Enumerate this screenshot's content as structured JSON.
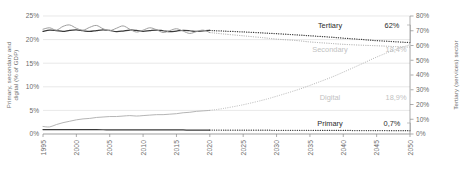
{
  "chart_data": {
    "type": "line",
    "title": "",
    "xlabel": "",
    "ylabel": "Primary, secondary and digital (% of GDP)",
    "y2label": "Tertiary (services) sector",
    "xlim": [
      1995,
      2050
    ],
    "ylim": [
      0,
      25
    ],
    "y2lim": [
      0,
      80
    ],
    "grid": true,
    "legend_position": "inline-right-callouts",
    "forecast_start": 2020,
    "x_ticks": [
      1995,
      2000,
      2005,
      2010,
      2015,
      2020,
      2025,
      2030,
      2035,
      2040,
      2045,
      2050
    ],
    "y_ticks": [
      "0%",
      "5%",
      "10%",
      "15%",
      "20%",
      "25%"
    ],
    "y2_ticks": [
      "0%",
      "10%",
      "20%",
      "30%",
      "40%",
      "50%",
      "60%",
      "70%",
      "80%"
    ],
    "series": [
      {
        "name": "Tertiary",
        "end_label": "62%",
        "axis": "right",
        "color": "#3a3a3a",
        "x": [
          1995,
          1996,
          1997,
          1998,
          1999,
          2000,
          2001,
          2002,
          2003,
          2004,
          2005,
          2006,
          2007,
          2008,
          2009,
          2010,
          2011,
          2012,
          2013,
          2014,
          2015,
          2016,
          2017,
          2018,
          2019,
          2020,
          2022,
          2025,
          2028,
          2030,
          2033,
          2035,
          2038,
          2040,
          2043,
          2045,
          2048,
          2050
        ],
        "values": [
          69.6,
          70.4,
          70.1,
          69.6,
          70.3,
          70.6,
          70.0,
          69.5,
          70.1,
          70.6,
          70.2,
          69.4,
          69.8,
          70.5,
          70.2,
          69.6,
          70.1,
          70.5,
          70.0,
          69.4,
          69.8,
          70.3,
          70.0,
          69.5,
          69.9,
          70.2,
          69.8,
          69.2,
          68.5,
          68.0,
          67.2,
          66.6,
          65.7,
          65.0,
          64.0,
          63.3,
          62.5,
          62.0
        ]
      },
      {
        "name": "Secondary",
        "end_label": "18,4%",
        "axis": "left",
        "color": "#9e9e9e",
        "x": [
          1995,
          1996,
          1997,
          1998,
          1999,
          2000,
          2001,
          2002,
          2003,
          2004,
          2005,
          2006,
          2007,
          2008,
          2009,
          2010,
          2011,
          2012,
          2013,
          2014,
          2015,
          2016,
          2017,
          2018,
          2019,
          2020,
          2022,
          2025,
          2028,
          2030,
          2033,
          2035,
          2038,
          2040,
          2043,
          2045,
          2048,
          2050
        ],
        "values": [
          22.2,
          22.5,
          22.0,
          22.8,
          23.1,
          22.4,
          22.0,
          22.6,
          23.0,
          22.3,
          21.9,
          22.4,
          22.9,
          22.2,
          21.6,
          22.0,
          22.5,
          22.1,
          21.5,
          21.9,
          22.3,
          21.8,
          21.3,
          21.7,
          22.0,
          21.5,
          21.2,
          20.8,
          20.4,
          20.1,
          19.8,
          19.5,
          19.2,
          19.0,
          18.8,
          18.7,
          18.5,
          18.4
        ]
      },
      {
        "name": "Digital",
        "end_label": "18,9%",
        "axis": "left",
        "color": "#b5b5b5",
        "x": [
          1995,
          1996,
          1997,
          1998,
          1999,
          2000,
          2001,
          2002,
          2003,
          2004,
          2005,
          2006,
          2007,
          2008,
          2009,
          2010,
          2011,
          2012,
          2013,
          2014,
          2015,
          2016,
          2017,
          2018,
          2019,
          2020,
          2022,
          2025,
          2028,
          2030,
          2033,
          2035,
          2038,
          2040,
          2043,
          2045,
          2048,
          2050
        ],
        "values": [
          1.6,
          1.5,
          2.0,
          2.4,
          2.7,
          3.0,
          3.2,
          3.3,
          3.5,
          3.6,
          3.7,
          3.7,
          3.8,
          3.9,
          3.8,
          3.9,
          4.0,
          4.1,
          4.1,
          4.2,
          4.3,
          4.5,
          4.6,
          4.8,
          4.9,
          5.0,
          5.4,
          6.2,
          7.2,
          8.0,
          9.3,
          10.3,
          11.9,
          13.1,
          15.0,
          16.3,
          18.0,
          18.9
        ]
      },
      {
        "name": "Primary",
        "end_label": "0,7%",
        "axis": "left",
        "color": "#3a3a3a",
        "x": [
          1995,
          1996,
          1997,
          1998,
          1999,
          2000,
          2001,
          2002,
          2003,
          2004,
          2005,
          2006,
          2007,
          2008,
          2009,
          2010,
          2011,
          2012,
          2013,
          2014,
          2015,
          2016,
          2017,
          2018,
          2019,
          2020,
          2022,
          2025,
          2028,
          2030,
          2033,
          2035,
          2038,
          2040,
          2043,
          2045,
          2048,
          2050
        ],
        "values": [
          0.95,
          0.95,
          0.94,
          0.93,
          0.93,
          0.92,
          0.92,
          0.91,
          0.91,
          0.9,
          0.9,
          0.89,
          0.89,
          0.88,
          0.88,
          0.88,
          0.87,
          0.87,
          0.86,
          0.86,
          0.85,
          0.85,
          0.84,
          0.84,
          0.83,
          0.83,
          0.82,
          0.81,
          0.8,
          0.79,
          0.78,
          0.77,
          0.76,
          0.75,
          0.73,
          0.72,
          0.71,
          0.7
        ]
      }
    ]
  }
}
